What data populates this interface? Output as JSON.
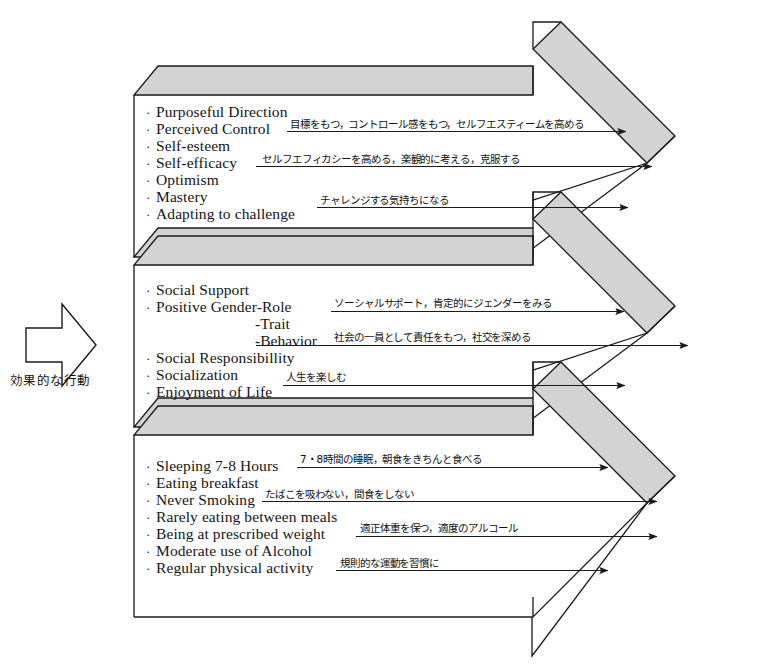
{
  "figure": {
    "left_caption": "効果的な行動",
    "left_arrow_icon": "right-arrow-icon",
    "fill_gray": "#d3d3d3",
    "stroke": "#1a1a1a",
    "background": "#ffffff"
  },
  "bands": [
    {
      "id": "band-psychological",
      "items": [
        "Purposeful Direction",
        "Perceived Control",
        "Self-esteem",
        "Self-efficacy",
        "Optimism",
        "Mastery",
        "Adapting to challenge"
      ],
      "sub_items": [],
      "annotations": [
        "目標をもつ，コントロール感をもつ，セルフエスティームを高める",
        "セルフエフィカシーを高める，楽観的に考える，克服する",
        "チャレンジする気持ちになる"
      ]
    },
    {
      "id": "band-social",
      "items": [
        "Social Support",
        "Positive Gender-Role",
        "Social Responsibillity",
        "Socialization",
        "Enjoyment of Life"
      ],
      "sub_items": [
        "-Trait",
        "-Behavior"
      ],
      "annotations": [
        "ソーシャルサポート，肯定的にジェンダーをみる",
        "社会の一員として責任をもつ，社交を深める",
        "人生を楽しむ"
      ]
    },
    {
      "id": "band-lifestyle",
      "items": [
        "Sleeping 7-8 Hours",
        "Eating breakfast",
        "Never Smoking",
        "Rarely eating between meals",
        "Being at prescribed weight",
        "Moderate use of Alcohol",
        "Regular physical activity"
      ],
      "sub_items": [],
      "annotations": [
        "7・8時間の睡眠，朝食をきちんと食べる",
        "たばこを吸わない，間食をしない",
        "適正体重を保つ，適度のアルコール",
        "規則的な運動を習慣に"
      ]
    }
  ]
}
